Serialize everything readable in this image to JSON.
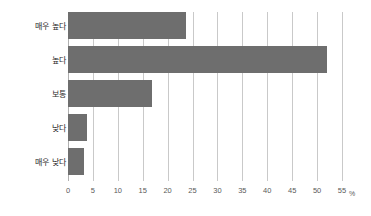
{
  "chart_data": {
    "type": "bar",
    "orientation": "horizontal",
    "title": "",
    "subtitle": "",
    "xlabel": "%",
    "ylabel": "",
    "categories": [
      "매우 높다",
      "높다",
      "보통",
      "낮다",
      "매우 낮다"
    ],
    "values": [
      23.7,
      52.0,
      16.8,
      3.8,
      3.3
    ],
    "series": [
      {
        "name": "",
        "values": [
          23.7,
          52.0,
          16.8,
          3.8,
          3.3
        ]
      }
    ],
    "xlim": [
      0,
      55
    ],
    "ylim": null,
    "xticks": [
      0,
      5,
      10,
      15,
      20,
      25,
      30,
      35,
      40,
      45,
      50,
      55
    ],
    "xtick_labels": [
      "0",
      "5",
      "10",
      "15",
      "20",
      "25",
      "30",
      "35",
      "40",
      "45",
      "50",
      "55"
    ],
    "unit": "%",
    "grid": "vertical",
    "legend": null,
    "legend_position": "none",
    "bar_color": "#6e6e6e",
    "gridline_color": "#c9c9c9",
    "background_color": "#ffffff",
    "annotations": []
  }
}
